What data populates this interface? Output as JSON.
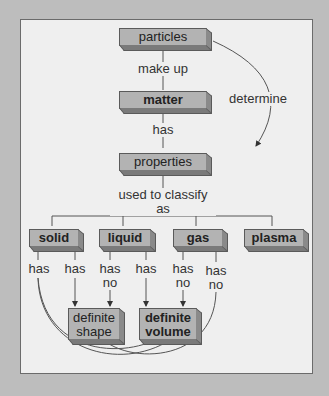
{
  "nodes": {
    "particles": "particles",
    "matter": "matter",
    "properties": "properties",
    "solid": "solid",
    "liquid": "liquid",
    "gas": "gas",
    "plasma": "plasma",
    "shape_line1": "definite",
    "shape_line2": "shape",
    "volume_line1": "definite",
    "volume_line2": "volume"
  },
  "links": {
    "make_up": "make up",
    "has": "has",
    "determine": "determine",
    "classify": "used to classify as",
    "solid_has_1": "has",
    "solid_has_2": "has",
    "liquid_has_no_1": "has",
    "liquid_has_no_2": "no",
    "liquid_has": "has",
    "gas_has_no_a1": "has",
    "gas_has_no_a2": "no",
    "gas_has_no_b1": "has",
    "gas_has_no_b2": "no"
  }
}
